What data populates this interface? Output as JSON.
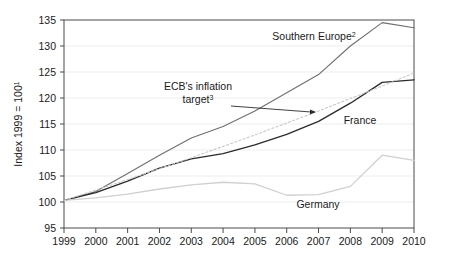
{
  "chart_data": {
    "type": "line",
    "title": "",
    "subtitle": "",
    "xlabel": "",
    "ylabel": "Index 1999 = 100",
    "ylabel_superscript": "1",
    "x": [
      1999,
      2000,
      2001,
      2002,
      2003,
      2004,
      2005,
      2006,
      2007,
      2008,
      2009,
      2010
    ],
    "xticklabels": [
      "1999",
      "2000",
      "2001",
      "2002",
      "2003",
      "2004",
      "2005",
      "2006",
      "2007",
      "2008",
      "2009",
      "2010"
    ],
    "yticklabels": [
      "95",
      "100",
      "105",
      "110",
      "115",
      "120",
      "125",
      "130",
      "135"
    ],
    "yticks": [
      95,
      100,
      105,
      110,
      115,
      120,
      125,
      130,
      135
    ],
    "ylim": [
      95,
      135
    ],
    "xlim": [
      1999,
      2010
    ],
    "grid": true,
    "legend": "inline-annotations",
    "series": [
      {
        "name": "Southern Europe",
        "superscript": "2",
        "color": "#6f6f6f",
        "style": "solid",
        "values": [
          100.3,
          102.0,
          105.5,
          109.0,
          112.3,
          114.5,
          117.5,
          121.0,
          124.5,
          130.0,
          134.5,
          133.5
        ]
      },
      {
        "name": "France",
        "superscript": "",
        "color": "#2b2b2b",
        "style": "solid",
        "values": [
          100.3,
          101.8,
          104.0,
          106.5,
          108.3,
          109.3,
          111.0,
          113.0,
          115.5,
          119.0,
          123.0,
          123.5
        ]
      },
      {
        "name": "Germany",
        "superscript": "",
        "color": "#d0d0d0",
        "style": "solid",
        "values": [
          100.3,
          100.8,
          101.5,
          102.5,
          103.3,
          103.8,
          103.5,
          101.3,
          101.4,
          103.0,
          109.0,
          108.0
        ]
      },
      {
        "name": "ECB's inflation target",
        "superscript": "3",
        "color": "#c9c9c9",
        "style": "dotted",
        "values": [
          100.3,
          102.3,
          104.3,
          106.4,
          108.5,
          110.7,
          112.9,
          115.2,
          117.5,
          119.9,
          122.3,
          124.8
        ]
      }
    ],
    "annotations": [
      {
        "text": "Southern Europe",
        "superscript": "2",
        "x_px": 314,
        "y_px": 40
      },
      {
        "text": "ECB's inflation",
        "superscript": "",
        "x_px": 198,
        "y_px": 90
      },
      {
        "text": "target",
        "superscript": "3",
        "x_px": 198,
        "y_px": 103
      },
      {
        "text": "France",
        "superscript": "",
        "x_px": 360,
        "y_px": 124
      },
      {
        "text": "Germany",
        "superscript": "",
        "x_px": 318,
        "y_px": 208
      }
    ],
    "arrow": {
      "from_x_px": 231,
      "from_y_px": 106,
      "to_x_px": 316,
      "to_y_px": 112
    }
  }
}
